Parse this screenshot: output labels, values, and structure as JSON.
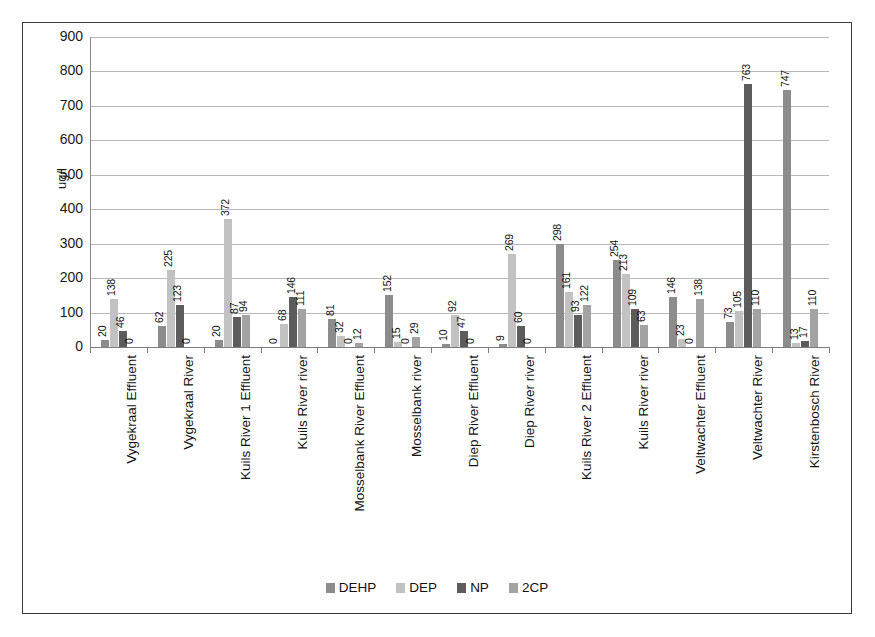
{
  "chart_data": {
    "type": "bar",
    "title": "",
    "xlabel": "",
    "ylabel": "ug/l",
    "ylim": [
      0,
      900
    ],
    "ytick_step": 100,
    "yticks": [
      900,
      800,
      700,
      600,
      500,
      400,
      300,
      200,
      100,
      0
    ],
    "grid": true,
    "legend_position": "bottom",
    "data_labels": true,
    "categories": [
      "Vygekraal Effluent",
      "Vygekraal River",
      "Kuils River 1 Effluent",
      "Kuils River river",
      "Mosselbank River Effluent",
      "Mosselbank river",
      "Diep River Effluent",
      "Diep River river",
      "Kuils River 2 Effluent",
      "Kuils River river",
      "Veltwachter Effluent",
      "Veltwachter River",
      "Kirstenbosch River"
    ],
    "series": [
      {
        "name": "DEHP",
        "color": "#8c8c8c",
        "values": [
          20,
          62,
          20,
          0,
          81,
          152,
          10,
          9,
          298,
          254,
          146,
          73,
          747
        ]
      },
      {
        "name": "DEP",
        "color": "#c2c2c2",
        "values": [
          138,
          225,
          372,
          68,
          32,
          15,
          92,
          269,
          161,
          213,
          23,
          105,
          13
        ]
      },
      {
        "name": "NP",
        "color": "#5c5c5c",
        "values": [
          46,
          123,
          87,
          146,
          0,
          0,
          47,
          60,
          93,
          109,
          0,
          763,
          17
        ]
      },
      {
        "name": "2CP",
        "color": "#a3a3a3",
        "values": [
          0,
          0,
          94,
          111,
          12,
          29,
          0,
          0,
          122,
          63,
          138,
          110,
          110
        ]
      }
    ]
  }
}
